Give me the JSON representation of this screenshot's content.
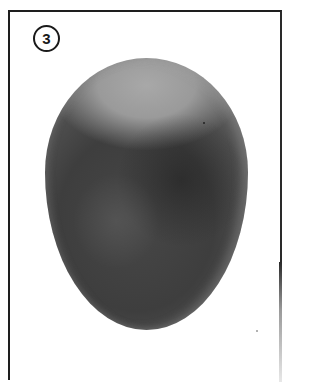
{
  "figure": {
    "label": "3",
    "colors": {
      "frame": "#1e1e1e",
      "egg_top": "#9a9a9a",
      "egg_body": "#3e3e3e",
      "egg_dark_patch": "#2a2a2a",
      "background": "#ffffff"
    }
  }
}
